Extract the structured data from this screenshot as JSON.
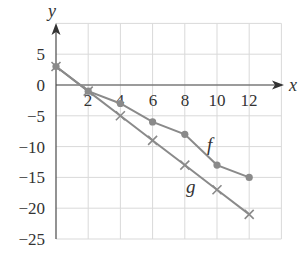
{
  "chart_data": {
    "type": "line",
    "title": "",
    "xlabel": "x",
    "ylabel": "y",
    "x": [
      0,
      2,
      4,
      6,
      8,
      10,
      12
    ],
    "series": [
      {
        "name": "f",
        "marker": "circle",
        "values": [
          3,
          -1,
          -3,
          -6,
          -8,
          -13,
          -15
        ]
      },
      {
        "name": "g",
        "marker": "x",
        "values": [
          3,
          -1,
          -5,
          -9,
          -13,
          -17,
          -21
        ]
      }
    ],
    "xlim": [
      0,
      14
    ],
    "ylim": [
      -25,
      10
    ],
    "x_ticks": [
      2,
      4,
      6,
      8,
      10,
      12
    ],
    "y_ticks": [
      5,
      0,
      -5,
      -10,
      -15,
      -20,
      -25
    ],
    "grid": true,
    "legend": "inline labels next to lines"
  },
  "labels": {
    "x_axis": "x",
    "y_axis": "y",
    "f": "f",
    "g": "g",
    "x_ticks": [
      "2",
      "4",
      "6",
      "8",
      "10",
      "12"
    ],
    "y_ticks": [
      "5",
      "0",
      "−5",
      "−10",
      "−15",
      "−20",
      "−25"
    ]
  },
  "colors": {
    "line": "#8a8a8a",
    "axis": "#4a4a4a",
    "grid": "#d9d9d9"
  }
}
